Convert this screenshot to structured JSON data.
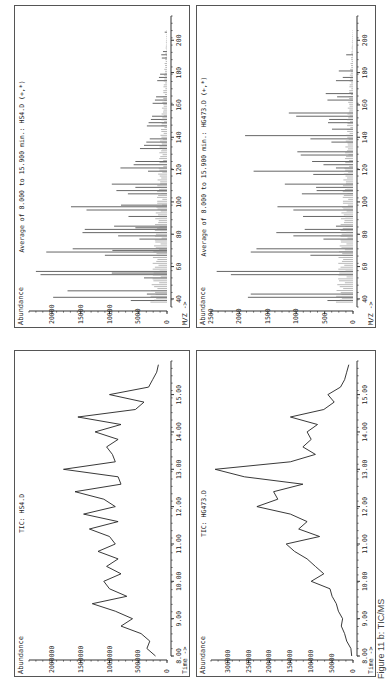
{
  "caption": "Figure 11 b: TIC/MS",
  "chart_data": [
    {
      "id": "tic_hs4",
      "type": "line",
      "title": "TIC: HS4.D",
      "xlabel": "Time ->",
      "ylabel": "Abundance",
      "xlim": [
        8.0,
        15.9
      ],
      "ylim": [
        0,
        2400000
      ],
      "xticks": [
        "8.00",
        "9.00",
        "10.00",
        "11.00",
        "12.00",
        "13.00",
        "14.00",
        "15.00"
      ],
      "yticks": [
        "0",
        "500000",
        "1000000",
        "1500000",
        "2000000"
      ],
      "x": [
        8.0,
        8.2,
        8.4,
        8.6,
        8.8,
        9.0,
        9.2,
        9.4,
        9.6,
        9.8,
        10.0,
        10.2,
        10.4,
        10.6,
        10.8,
        11.0,
        11.2,
        11.4,
        11.6,
        11.8,
        12.0,
        12.2,
        12.4,
        12.6,
        12.8,
        13.0,
        13.2,
        13.4,
        13.6,
        13.8,
        14.0,
        14.2,
        14.4,
        14.6,
        14.8,
        15.0,
        15.2,
        15.4,
        15.6,
        15.8
      ],
      "values": [
        200000,
        350000,
        300000,
        450000,
        800000,
        600000,
        900000,
        1300000,
        700000,
        1000000,
        1100000,
        800000,
        1050000,
        850000,
        1200000,
        900000,
        1000000,
        1350000,
        850000,
        1450000,
        900000,
        1100000,
        1600000,
        800000,
        850000,
        1800000,
        900000,
        950000,
        1050000,
        850000,
        1250000,
        800000,
        1550000,
        550000,
        400000,
        1000000,
        320000,
        250000,
        180000,
        150000
      ]
    },
    {
      "id": "tic_hg473",
      "type": "line",
      "title": "TIC: HG473.D",
      "xlabel": "Time ->",
      "ylabel": "Abundance",
      "xlim": [
        8.0,
        15.9
      ],
      "ylim": [
        0,
        340000
      ],
      "xticks": [
        "8.00",
        "9.00",
        "10.00",
        "11.00",
        "12.00",
        "13.00",
        "14.00",
        "15.00"
      ],
      "yticks": [
        "0",
        "50000",
        "100000",
        "150000",
        "200000",
        "250000",
        "300000"
      ],
      "x": [
        8.0,
        8.2,
        8.4,
        8.6,
        8.8,
        9.0,
        9.2,
        9.4,
        9.6,
        9.8,
        10.0,
        10.2,
        10.4,
        10.6,
        10.8,
        11.0,
        11.2,
        11.4,
        11.6,
        11.8,
        12.0,
        12.2,
        12.4,
        12.6,
        12.8,
        13.0,
        13.2,
        13.4,
        13.6,
        13.8,
        14.0,
        14.2,
        14.4,
        14.6,
        14.8,
        15.0,
        15.2,
        15.4,
        15.6,
        15.8
      ],
      "values": [
        3000,
        5000,
        15000,
        20000,
        28000,
        25000,
        35000,
        40000,
        50000,
        55000,
        100000,
        70000,
        90000,
        110000,
        140000,
        160000,
        80000,
        130000,
        110000,
        150000,
        230000,
        180000,
        190000,
        120000,
        260000,
        330000,
        150000,
        90000,
        120000,
        100000,
        110000,
        85000,
        150000,
        70000,
        45000,
        60000,
        30000,
        20000,
        15000,
        10000
      ]
    },
    {
      "id": "ms_hs4",
      "type": "bar",
      "title": "Average of 8.000 to 15.900 min.: HS4.D (+,*)",
      "xlabel": "M/Z ->",
      "ylabel": "Abundance",
      "xlim": [
        35,
        215
      ],
      "ylim": [
        0,
        24000
      ],
      "xticks": [
        "40",
        "60",
        "80",
        "100",
        "120",
        "140",
        "160",
        "180",
        "200"
      ],
      "yticks": [
        "0",
        "5000",
        "10000",
        "15000",
        "20000"
      ],
      "x": [
        39,
        41,
        43,
        45,
        53,
        55,
        56,
        57,
        67,
        69,
        70,
        71,
        77,
        79,
        81,
        83,
        84,
        85,
        91,
        95,
        97,
        98,
        105,
        107,
        109,
        111,
        119,
        121,
        123,
        125,
        133,
        135,
        137,
        139,
        147,
        149,
        151,
        153,
        161,
        163,
        165,
        175,
        177,
        179,
        189,
        191,
        193,
        205
      ],
      "values": [
        6300,
        19800,
        3500,
        17300,
        4000,
        22000,
        9600,
        22800,
        10800,
        21000,
        9500,
        16400,
        4800,
        8500,
        14700,
        14300,
        5500,
        9200,
        6700,
        14000,
        16700,
        8000,
        6800,
        8800,
        5500,
        9600,
        3300,
        8100,
        5800,
        5500,
        4700,
        4000,
        3600,
        3000,
        3500,
        3200,
        2800,
        2600,
        2500,
        2100,
        1900,
        1700,
        1400,
        1200,
        900,
        1000,
        700,
        400
      ]
    },
    {
      "id": "ms_hg473",
      "type": "bar",
      "title": "Average of 8.000 to 15.900 min.: HG473.D (+,*)",
      "xlabel": "M/Z ->",
      "ylabel": "Abundance",
      "xlim": [
        35,
        215
      ],
      "ylim": [
        0,
        2500
      ],
      "xticks": [
        "40",
        "60",
        "80",
        "100",
        "120",
        "140",
        "160",
        "180",
        "200"
      ],
      "yticks": [
        "0",
        "500",
        "1000",
        "1500",
        "2000",
        "2500"
      ],
      "x": [
        39,
        41,
        43,
        55,
        57,
        67,
        69,
        71,
        77,
        79,
        81,
        83,
        85,
        91,
        95,
        97,
        105,
        107,
        109,
        111,
        117,
        119,
        121,
        123,
        125,
        129,
        131,
        137,
        139,
        141,
        145,
        149,
        151,
        153,
        155,
        163,
        165,
        167,
        175,
        177,
        181,
        191
      ],
      "values": [
        450,
        1850,
        1800,
        2150,
        2400,
        750,
        1800,
        1700,
        520,
        1050,
        1350,
        850,
        300,
        880,
        1050,
        1330,
        900,
        640,
        650,
        1200,
        700,
        1750,
        300,
        520,
        720,
        920,
        980,
        380,
        750,
        1900,
        370,
        440,
        420,
        1000,
        1130,
        450,
        280,
        480,
        300,
        180,
        250,
        120
      ]
    }
  ]
}
